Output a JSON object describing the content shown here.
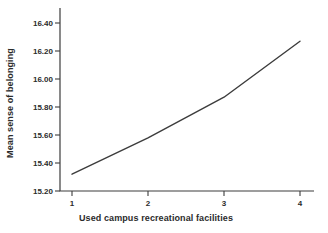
{
  "figure": {
    "background_color": "#ffffff",
    "text_color": "#2b2b2b",
    "line_color": "#3c3c3c"
  },
  "chart_data": {
    "type": "line",
    "title": "",
    "xlabel": "Used campus recreational facilities",
    "ylabel": "Mean sense of belonging",
    "x": [
      1,
      2,
      3,
      4
    ],
    "values": [
      15.32,
      15.58,
      15.87,
      16.27
    ],
    "series": [
      {
        "name": "Mean sense of belonging",
        "values": [
          15.32,
          15.58,
          15.87,
          16.27
        ]
      }
    ],
    "xticks": [
      1,
      2,
      3,
      4
    ],
    "xtick_labels": [
      "1",
      "2",
      "3",
      "4"
    ],
    "yticks": [
      15.2,
      15.4,
      15.6,
      15.8,
      16.0,
      16.2,
      16.4
    ],
    "ytick_labels": [
      "15.20",
      "15.40",
      "15.60",
      "15.80",
      "16.00",
      "16.20",
      "16.40"
    ],
    "xlim": [
      0.85,
      4.2
    ],
    "ylim": [
      15.2,
      16.5
    ],
    "grid": false,
    "legend_position": "none"
  }
}
